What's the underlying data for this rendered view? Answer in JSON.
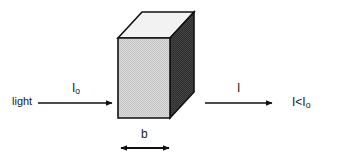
{
  "diagram": {
    "background_color": "#ffffff",
    "labels": {
      "light": "light",
      "incident_intensity": "I",
      "incident_intensity_sub": "o",
      "transmitted_intensity": "I",
      "relation": "I<I",
      "relation_sub": "o",
      "path_length": "b"
    },
    "colors": {
      "front_face": "#d2d2d2",
      "top_face": "#f2f2f2",
      "side_face": "#333333",
      "stroke": "#111111",
      "text": "#1a1a1a"
    },
    "icons": {
      "incident_arrow": "right-arrow-icon",
      "transmitted_arrow": "right-arrow-icon",
      "path_length_arrow": "double-headed-arrow-icon",
      "sample_box": "cuvette-box-icon"
    },
    "geometry": {
      "front_face_points": "118,38 170,38 170,118 118,118",
      "top_face_points": "118,38 142,12 194,12 170,38",
      "side_face_points": "170,38 194,12 194,92 170,118",
      "incident_arrow_line": {
        "x1": 38,
        "y1": 103,
        "x2": 112,
        "y2": 103
      },
      "transmitted_arrow_line": {
        "x1": 205,
        "y1": 103,
        "x2": 272,
        "y2": 103
      },
      "path_arrow_line": {
        "x1": 120,
        "y1": 148,
        "x2": 170,
        "y2": 148
      }
    }
  }
}
